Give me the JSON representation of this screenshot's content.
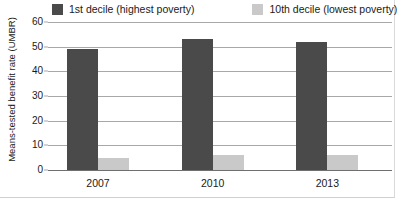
{
  "chart_data": {
    "type": "bar",
    "title": "",
    "subtitle": "",
    "xlabel": "",
    "ylabel": "Means-tested benefit rate (UMBR)",
    "categories": [
      "2007",
      "2010",
      "2013"
    ],
    "series": [
      {
        "name": "1st decile (highest poverty)",
        "color": "#4a4a4a",
        "values": [
          49,
          53,
          52
        ]
      },
      {
        "name": "10th decile (lowest poverty)",
        "color": "#c9c9c9",
        "values": [
          5,
          6,
          6
        ]
      }
    ],
    "ylim": [
      0,
      60
    ],
    "yticks": [
      0,
      10,
      20,
      30,
      40,
      50,
      60
    ],
    "ytick_labels": [
      "0",
      "10",
      "20",
      "30",
      "40",
      "50",
      "60"
    ],
    "grid": true,
    "grid_axis": "y",
    "legend_position": "top",
    "legend_orientation": "horizontal",
    "bar_group_mode": "grouped"
  },
  "colors": {
    "series_dark": "#4a4a4a",
    "series_light": "#c9c9c9",
    "gridline": "#a8a8a8",
    "axis": "#6f6f6f",
    "text": "#1a1a1a",
    "background": "#ffffff"
  }
}
